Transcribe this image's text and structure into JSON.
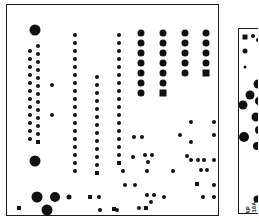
{
  "figure": {
    "kind": "pcb-pad-layout",
    "background_color": "#ffffff",
    "outline_color": "#1a1a1a",
    "pad_color": "#111111",
    "width": 258,
    "height": 222
  },
  "main_board": {
    "name": "main-board",
    "x": 6,
    "y": 4,
    "width": 213,
    "height": 212
  },
  "side_board": {
    "name": "side-board",
    "x": 238,
    "y": 28,
    "width": 22,
    "height": 186,
    "labels": [
      {
        "text": "MAP",
        "x": 6,
        "y": 190,
        "size": 5.5,
        "rotate": -90
      },
      {
        "text": "T216A",
        "x": 12,
        "y": 190,
        "size": 5.5,
        "rotate": -90
      },
      {
        "text": "Comp",
        "x": 18,
        "y": 190,
        "size": 5.5,
        "rotate": -90
      }
    ],
    "pads": [
      {
        "x": 6,
        "y": 8,
        "d": 5,
        "shape": "square"
      },
      {
        "x": 14,
        "y": 7,
        "d": 4,
        "shape": "round"
      },
      {
        "x": 19,
        "y": 11,
        "d": 4,
        "shape": "round"
      },
      {
        "x": 6,
        "y": 22,
        "d": 5,
        "shape": "round"
      },
      {
        "x": 6,
        "y": 38,
        "d": 3,
        "shape": "round"
      },
      {
        "x": 19,
        "y": 55,
        "d": 9,
        "shape": "round"
      },
      {
        "x": 11,
        "y": 66,
        "d": 9,
        "shape": "round"
      },
      {
        "x": 20,
        "y": 72,
        "d": 8,
        "shape": "round"
      },
      {
        "x": 4,
        "y": 76,
        "d": 9,
        "shape": "round"
      },
      {
        "x": 17,
        "y": 88,
        "d": 9,
        "shape": "round"
      },
      {
        "x": 20,
        "y": 101,
        "d": 8,
        "shape": "round"
      },
      {
        "x": 5,
        "y": 108,
        "d": 10,
        "shape": "round"
      },
      {
        "x": 18,
        "y": 117,
        "d": 8,
        "shape": "round"
      },
      {
        "x": 18,
        "y": 170,
        "d": 7,
        "shape": "round"
      }
    ]
  },
  "pads": [
    {
      "x": 28,
      "y": 25,
      "d": 11,
      "shape": "round"
    },
    {
      "x": 23,
      "y": 46,
      "d": 4,
      "shape": "round"
    },
    {
      "x": 23,
      "y": 54,
      "d": 4,
      "shape": "round"
    },
    {
      "x": 23,
      "y": 62,
      "d": 4,
      "shape": "round"
    },
    {
      "x": 23,
      "y": 70,
      "d": 4,
      "shape": "round"
    },
    {
      "x": 23,
      "y": 78,
      "d": 4,
      "shape": "round"
    },
    {
      "x": 23,
      "y": 86,
      "d": 4,
      "shape": "round"
    },
    {
      "x": 23,
      "y": 94,
      "d": 4,
      "shape": "round"
    },
    {
      "x": 23,
      "y": 102,
      "d": 4,
      "shape": "round"
    },
    {
      "x": 23,
      "y": 110,
      "d": 4,
      "shape": "round"
    },
    {
      "x": 23,
      "y": 118,
      "d": 4,
      "shape": "round"
    },
    {
      "x": 23,
      "y": 126,
      "d": 4,
      "shape": "round"
    },
    {
      "x": 23,
      "y": 134,
      "d": 4,
      "shape": "round"
    },
    {
      "x": 31,
      "y": 41,
      "d": 4,
      "shape": "round"
    },
    {
      "x": 31,
      "y": 49,
      "d": 4,
      "shape": "round"
    },
    {
      "x": 31,
      "y": 57,
      "d": 4,
      "shape": "round"
    },
    {
      "x": 31,
      "y": 65,
      "d": 4,
      "shape": "round"
    },
    {
      "x": 31,
      "y": 73,
      "d": 4,
      "shape": "round"
    },
    {
      "x": 31,
      "y": 81,
      "d": 4,
      "shape": "round"
    },
    {
      "x": 31,
      "y": 89,
      "d": 4,
      "shape": "round"
    },
    {
      "x": 31,
      "y": 97,
      "d": 4,
      "shape": "round"
    },
    {
      "x": 31,
      "y": 105,
      "d": 4,
      "shape": "round"
    },
    {
      "x": 31,
      "y": 113,
      "d": 4,
      "shape": "round"
    },
    {
      "x": 31,
      "y": 121,
      "d": 4,
      "shape": "round"
    },
    {
      "x": 31,
      "y": 129,
      "d": 4,
      "shape": "round"
    },
    {
      "x": 31,
      "y": 137,
      "d": 4,
      "shape": "square"
    },
    {
      "x": 28,
      "y": 156,
      "d": 11,
      "shape": "round"
    },
    {
      "x": 45,
      "y": 80,
      "d": 4,
      "shape": "round"
    },
    {
      "x": 45,
      "y": 110,
      "d": 4,
      "shape": "round"
    },
    {
      "x": 68,
      "y": 30,
      "d": 4,
      "shape": "round"
    },
    {
      "x": 68,
      "y": 38,
      "d": 4,
      "shape": "round"
    },
    {
      "x": 68,
      "y": 46,
      "d": 4,
      "shape": "round"
    },
    {
      "x": 68,
      "y": 54,
      "d": 4,
      "shape": "round"
    },
    {
      "x": 68,
      "y": 62,
      "d": 4,
      "shape": "round"
    },
    {
      "x": 68,
      "y": 70,
      "d": 4,
      "shape": "round"
    },
    {
      "x": 68,
      "y": 78,
      "d": 4,
      "shape": "round"
    },
    {
      "x": 68,
      "y": 86,
      "d": 4,
      "shape": "round"
    },
    {
      "x": 68,
      "y": 94,
      "d": 4,
      "shape": "round"
    },
    {
      "x": 68,
      "y": 102,
      "d": 4,
      "shape": "round"
    },
    {
      "x": 68,
      "y": 110,
      "d": 4,
      "shape": "round"
    },
    {
      "x": 68,
      "y": 118,
      "d": 4,
      "shape": "round"
    },
    {
      "x": 68,
      "y": 126,
      "d": 4,
      "shape": "round"
    },
    {
      "x": 68,
      "y": 134,
      "d": 4,
      "shape": "round"
    },
    {
      "x": 68,
      "y": 142,
      "d": 4,
      "shape": "round"
    },
    {
      "x": 68,
      "y": 150,
      "d": 4,
      "shape": "round"
    },
    {
      "x": 68,
      "y": 158,
      "d": 4,
      "shape": "round"
    },
    {
      "x": 68,
      "y": 166,
      "d": 4,
      "shape": "round"
    },
    {
      "x": 90,
      "y": 72,
      "d": 4,
      "shape": "round"
    },
    {
      "x": 90,
      "y": 80,
      "d": 4,
      "shape": "round"
    },
    {
      "x": 90,
      "y": 88,
      "d": 4,
      "shape": "round"
    },
    {
      "x": 90,
      "y": 96,
      "d": 4,
      "shape": "round"
    },
    {
      "x": 90,
      "y": 104,
      "d": 4,
      "shape": "round"
    },
    {
      "x": 90,
      "y": 112,
      "d": 4,
      "shape": "round"
    },
    {
      "x": 90,
      "y": 120,
      "d": 4,
      "shape": "round"
    },
    {
      "x": 90,
      "y": 128,
      "d": 4,
      "shape": "round"
    },
    {
      "x": 90,
      "y": 136,
      "d": 4,
      "shape": "round"
    },
    {
      "x": 90,
      "y": 144,
      "d": 4,
      "shape": "round"
    },
    {
      "x": 90,
      "y": 152,
      "d": 4,
      "shape": "round"
    },
    {
      "x": 90,
      "y": 160,
      "d": 4,
      "shape": "round"
    },
    {
      "x": 90,
      "y": 168,
      "d": 4,
      "shape": "square"
    },
    {
      "x": 112,
      "y": 30,
      "d": 4,
      "shape": "round"
    },
    {
      "x": 112,
      "y": 38,
      "d": 4,
      "shape": "round"
    },
    {
      "x": 112,
      "y": 46,
      "d": 4,
      "shape": "round"
    },
    {
      "x": 112,
      "y": 54,
      "d": 4,
      "shape": "round"
    },
    {
      "x": 112,
      "y": 62,
      "d": 4,
      "shape": "round"
    },
    {
      "x": 112,
      "y": 70,
      "d": 4,
      "shape": "round"
    },
    {
      "x": 112,
      "y": 78,
      "d": 4,
      "shape": "round"
    },
    {
      "x": 112,
      "y": 86,
      "d": 4,
      "shape": "round"
    },
    {
      "x": 112,
      "y": 94,
      "d": 4,
      "shape": "round"
    },
    {
      "x": 112,
      "y": 102,
      "d": 4,
      "shape": "round"
    },
    {
      "x": 112,
      "y": 110,
      "d": 4,
      "shape": "round"
    },
    {
      "x": 112,
      "y": 118,
      "d": 4,
      "shape": "round"
    },
    {
      "x": 112,
      "y": 126,
      "d": 4,
      "shape": "round"
    },
    {
      "x": 112,
      "y": 134,
      "d": 4,
      "shape": "round"
    },
    {
      "x": 112,
      "y": 142,
      "d": 4,
      "shape": "round"
    },
    {
      "x": 112,
      "y": 150,
      "d": 4,
      "shape": "round"
    },
    {
      "x": 112,
      "y": 158,
      "d": 4,
      "shape": "square"
    },
    {
      "x": 134,
      "y": 28,
      "d": 7,
      "shape": "round"
    },
    {
      "x": 134,
      "y": 38,
      "d": 7,
      "shape": "round"
    },
    {
      "x": 134,
      "y": 48,
      "d": 7,
      "shape": "round"
    },
    {
      "x": 134,
      "y": 58,
      "d": 7,
      "shape": "round"
    },
    {
      "x": 134,
      "y": 68,
      "d": 7,
      "shape": "round"
    },
    {
      "x": 134,
      "y": 78,
      "d": 7,
      "shape": "round"
    },
    {
      "x": 134,
      "y": 88,
      "d": 7,
      "shape": "round"
    },
    {
      "x": 156,
      "y": 28,
      "d": 7,
      "shape": "round"
    },
    {
      "x": 156,
      "y": 38,
      "d": 7,
      "shape": "round"
    },
    {
      "x": 156,
      "y": 48,
      "d": 7,
      "shape": "round"
    },
    {
      "x": 156,
      "y": 58,
      "d": 7,
      "shape": "round"
    },
    {
      "x": 156,
      "y": 68,
      "d": 7,
      "shape": "round"
    },
    {
      "x": 156,
      "y": 78,
      "d": 7,
      "shape": "round"
    },
    {
      "x": 156,
      "y": 88,
      "d": 7,
      "shape": "square"
    },
    {
      "x": 178,
      "y": 28,
      "d": 7,
      "shape": "round"
    },
    {
      "x": 178,
      "y": 38,
      "d": 7,
      "shape": "round"
    },
    {
      "x": 178,
      "y": 48,
      "d": 7,
      "shape": "round"
    },
    {
      "x": 178,
      "y": 58,
      "d": 7,
      "shape": "round"
    },
    {
      "x": 178,
      "y": 68,
      "d": 7,
      "shape": "round"
    },
    {
      "x": 199,
      "y": 28,
      "d": 7,
      "shape": "round"
    },
    {
      "x": 199,
      "y": 38,
      "d": 7,
      "shape": "round"
    },
    {
      "x": 199,
      "y": 48,
      "d": 7,
      "shape": "round"
    },
    {
      "x": 199,
      "y": 58,
      "d": 7,
      "shape": "round"
    },
    {
      "x": 199,
      "y": 68,
      "d": 7,
      "shape": "square"
    },
    {
      "x": 127,
      "y": 132,
      "d": 4,
      "shape": "round"
    },
    {
      "x": 135,
      "y": 132,
      "d": 4,
      "shape": "round"
    },
    {
      "x": 126,
      "y": 152,
      "d": 4,
      "shape": "round"
    },
    {
      "x": 138,
      "y": 150,
      "d": 4,
      "shape": "round"
    },
    {
      "x": 145,
      "y": 150,
      "d": 4,
      "shape": "round"
    },
    {
      "x": 141,
      "y": 157,
      "d": 4,
      "shape": "round"
    },
    {
      "x": 140,
      "y": 166,
      "d": 4,
      "shape": "round"
    },
    {
      "x": 128,
      "y": 180,
      "d": 4,
      "shape": "round"
    },
    {
      "x": 140,
      "y": 190,
      "d": 4,
      "shape": "round"
    },
    {
      "x": 147,
      "y": 190,
      "d": 4,
      "shape": "round"
    },
    {
      "x": 144,
      "y": 197,
      "d": 4,
      "shape": "round"
    },
    {
      "x": 157,
      "y": 192,
      "d": 4,
      "shape": "round"
    },
    {
      "x": 132,
      "y": 203,
      "d": 4,
      "shape": "round"
    },
    {
      "x": 139,
      "y": 203,
      "d": 4,
      "shape": "square"
    },
    {
      "x": 166,
      "y": 166,
      "d": 4,
      "shape": "round"
    },
    {
      "x": 173,
      "y": 130,
      "d": 4,
      "shape": "round"
    },
    {
      "x": 180,
      "y": 151,
      "d": 4,
      "shape": "round"
    },
    {
      "x": 184,
      "y": 155,
      "d": 4,
      "shape": "round"
    },
    {
      "x": 191,
      "y": 155,
      "d": 4,
      "shape": "round"
    },
    {
      "x": 197,
      "y": 155,
      "d": 4,
      "shape": "round"
    },
    {
      "x": 194,
      "y": 165,
      "d": 4,
      "shape": "round"
    },
    {
      "x": 200,
      "y": 165,
      "d": 4,
      "shape": "round"
    },
    {
      "x": 190,
      "y": 179,
      "d": 4,
      "shape": "square"
    },
    {
      "x": 196,
      "y": 192,
      "d": 4,
      "shape": "round"
    },
    {
      "x": 184,
      "y": 117,
      "d": 4,
      "shape": "round"
    },
    {
      "x": 184,
      "y": 137,
      "d": 4,
      "shape": "round"
    },
    {
      "x": 207,
      "y": 117,
      "d": 4,
      "shape": "round"
    },
    {
      "x": 207,
      "y": 130,
      "d": 4,
      "shape": "round"
    },
    {
      "x": 207,
      "y": 155,
      "d": 4,
      "shape": "round"
    },
    {
      "x": 207,
      "y": 180,
      "d": 4,
      "shape": "round"
    },
    {
      "x": 207,
      "y": 192,
      "d": 4,
      "shape": "round"
    },
    {
      "x": 30,
      "y": 192,
      "d": 11,
      "shape": "round"
    },
    {
      "x": 48,
      "y": 192,
      "d": 10,
      "shape": "round"
    },
    {
      "x": 40,
      "y": 205,
      "d": 11,
      "shape": "round"
    },
    {
      "x": 62,
      "y": 192,
      "d": 5,
      "shape": "round"
    },
    {
      "x": 83,
      "y": 192,
      "d": 4,
      "shape": "square"
    },
    {
      "x": 92,
      "y": 192,
      "d": 4,
      "shape": "round"
    },
    {
      "x": 93,
      "y": 205,
      "d": 4,
      "shape": "round"
    },
    {
      "x": 107,
      "y": 204,
      "d": 4,
      "shape": "square"
    },
    {
      "x": 116,
      "y": 166,
      "d": 4,
      "shape": "round"
    },
    {
      "x": 118,
      "y": 180,
      "d": 4,
      "shape": "round"
    },
    {
      "x": 110,
      "y": 205,
      "d": 4,
      "shape": "round"
    },
    {
      "x": 12,
      "y": 203,
      "d": 4,
      "shape": "square"
    }
  ]
}
